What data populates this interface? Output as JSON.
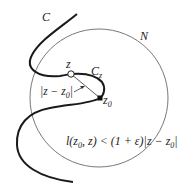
{
  "diagram": {
    "type": "geometric-illustration",
    "labels": {
      "curve": "C",
      "neighborhood": "N",
      "point_z": "z",
      "sub_arc": "C",
      "sub_arc_subscript": "z",
      "point_z0": "z",
      "point_z0_subscript": "0",
      "distance_label": "|z − z",
      "distance_label_subscript": "0",
      "distance_label_close": "|",
      "inequality": {
        "lhs_l": "l",
        "lhs_open": "(z",
        "lhs_sub": "0",
        "lhs_rest": ", z) < (1 + ε)|z − z",
        "rhs_sub": "0",
        "rhs_close": "|"
      }
    },
    "elements": [
      {
        "name": "curve-C",
        "kind": "thick curve",
        "color": "#1a1a1a"
      },
      {
        "name": "circle-N",
        "kind": "thin circle",
        "center": [
          99,
          98
        ],
        "radius": 69,
        "color": "#555555"
      },
      {
        "name": "point-z",
        "kind": "open circle marker",
        "position": [
          71,
          74
        ]
      },
      {
        "name": "point-z0",
        "kind": "filled square marker",
        "position": [
          100,
          98
        ]
      },
      {
        "name": "chord",
        "kind": "thin segment from z to z0"
      },
      {
        "name": "arrow",
        "kind": "arrow pointing to chord"
      }
    ]
  }
}
